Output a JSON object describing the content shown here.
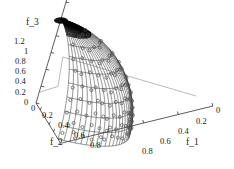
{
  "figure": {
    "type": "3d-surface-plot",
    "background": "#ffffff",
    "line_color": "#333333",
    "marker_color": "#555555",
    "apex_color": "#000000"
  },
  "axes": {
    "z": {
      "name": "f_3",
      "ticks": [
        "1.2",
        "1",
        "0.8",
        "0.6",
        "0.4",
        "0.2",
        "0"
      ],
      "values": [
        1.2,
        1,
        0.8,
        0.6,
        0.4,
        0.2,
        0
      ]
    },
    "x": {
      "name": "f_1",
      "ticks": [
        "0",
        "0.2",
        "0.4",
        "0.6",
        "0.8"
      ],
      "values": [
        0,
        0.2,
        0.4,
        0.6,
        0.8
      ]
    },
    "y": {
      "name": "f_2",
      "ticks": [
        "0",
        "0.2",
        "0.4",
        "0.6",
        "0.8"
      ],
      "values": [
        0,
        0.2,
        0.4,
        0.6,
        0.8
      ]
    }
  },
  "chart_data": {
    "type": "scatter",
    "title": "",
    "xlabel": "f_1",
    "ylabel": "f_2",
    "zlabel": "f_3",
    "xlim": [
      0,
      1
    ],
    "ylim": [
      0,
      1
    ],
    "zlim": [
      0,
      1.2
    ],
    "xticks": [
      0,
      0.2,
      0.4,
      0.6,
      0.8
    ],
    "yticks": [
      0,
      0.2,
      0.4,
      0.6,
      0.8
    ],
    "zticks": [
      0,
      0.2,
      0.4,
      0.6,
      0.8,
      1,
      1.2
    ],
    "grid": true,
    "legend": false,
    "surface": {
      "description": "unit sphere octant f_1^2 + f_2^2 + f_3^2 = 1, f_i >= 0",
      "mesh_u_divisions": 24,
      "mesh_v_divisions": 10
    },
    "points": {
      "marker": "open-circle",
      "count": 105,
      "description": "solution set distributed over the spherical octant surface"
    }
  }
}
